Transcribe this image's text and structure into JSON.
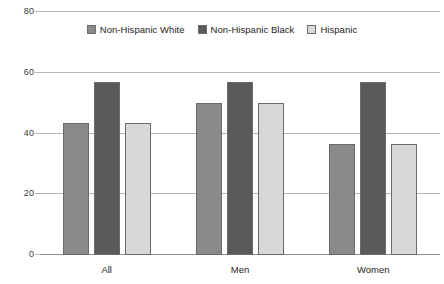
{
  "chart_data": {
    "type": "bar",
    "title": "",
    "xlabel": "",
    "ylabel": "",
    "categories": [
      "All",
      "Men",
      "Women"
    ],
    "series": [
      {
        "name": "Non-Hispanic White",
        "color": "#8a8a8a",
        "values": [
          43.5,
          50,
          36.5
        ]
      },
      {
        "name": "Non-Hispanic Black",
        "color": "#5a5a5a",
        "values": [
          57,
          57,
          57
        ]
      },
      {
        "name": "Hispanic",
        "color": "#d8d8d8",
        "values": [
          43.5,
          50,
          36.5
        ]
      }
    ],
    "ylim": [
      0,
      80
    ],
    "yticks": [
      0,
      20,
      40,
      60,
      80
    ],
    "ytick_labels": [
      "0",
      "20",
      "40",
      "60",
      "80"
    ],
    "grid": true,
    "legend_position": "top-center",
    "gridline_color": "#b4b4b4",
    "axis_color": "#8d8d8d",
    "bar_border_color": "#6a6a6a",
    "background": "#ffffff"
  }
}
